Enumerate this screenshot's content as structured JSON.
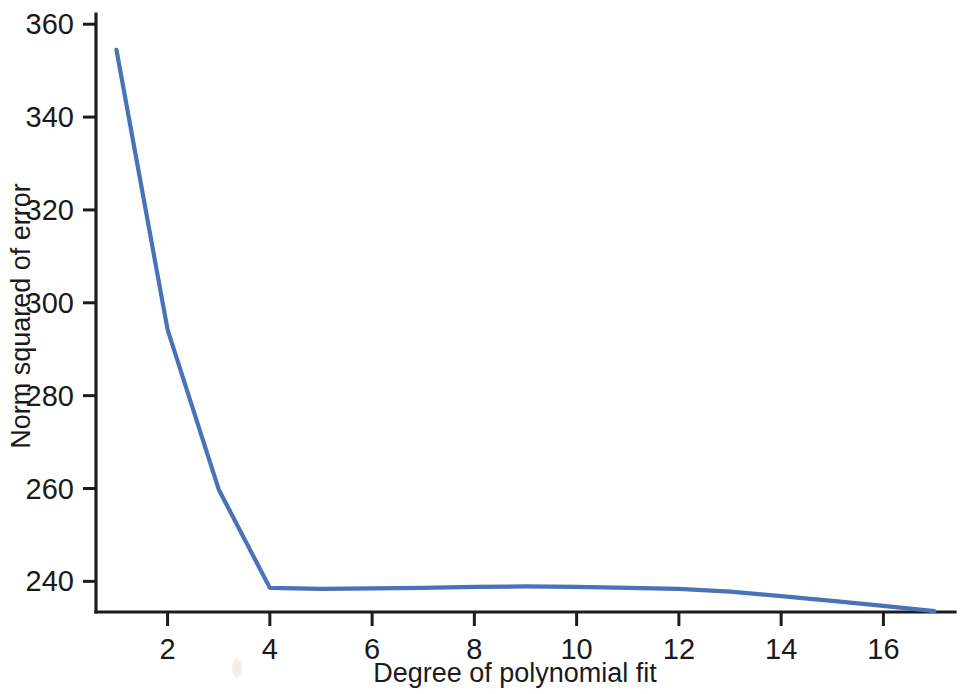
{
  "figure": {
    "background_color": "#ffffff",
    "axis_color": "#1c1c1c",
    "line_color": "#4A72B8"
  },
  "chart_data": {
    "type": "line",
    "title": "",
    "xlabel": "Degree of polynomial fit",
    "ylabel": "Norm squared of error",
    "xlim": [
      0.6,
      17.4
    ],
    "ylim": [
      233.4,
      362.2
    ],
    "grid": false,
    "legend": null,
    "x_ticks": [
      2,
      4,
      6,
      8,
      10,
      12,
      14,
      16
    ],
    "x_tick_labels": [
      "2",
      "4",
      "6",
      "8",
      "10",
      "12",
      "14",
      "16"
    ],
    "y_ticks": [
      240,
      260,
      280,
      300,
      320,
      340,
      360
    ],
    "y_tick_labels": [
      "240",
      "260",
      "280",
      "300",
      "320",
      "340",
      "360"
    ],
    "series": [
      {
        "name": "Norm squared of error",
        "color": "#4A72B8",
        "x": [
          1,
          2,
          3,
          4,
          5,
          6,
          7,
          8,
          9,
          10,
          11,
          12,
          13,
          14,
          15,
          16,
          17
        ],
        "values": [
          354.5,
          294.2,
          259.8,
          238.6,
          238.4,
          238.5,
          238.6,
          238.8,
          238.9,
          238.8,
          238.6,
          238.4,
          237.8,
          236.8,
          235.8,
          234.7,
          233.6
        ]
      }
    ]
  },
  "labels": {
    "x_axis_title": "Degree of polynomial fit",
    "y_axis_title": "Norm squared of error"
  }
}
